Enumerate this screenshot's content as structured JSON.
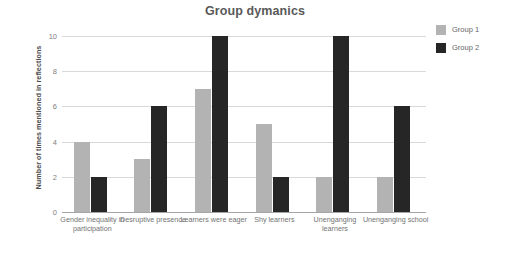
{
  "chart_data": {
    "type": "bar",
    "title": "Group dymanics",
    "xlabel": "",
    "ylabel": "Number of times mentioned in reflections",
    "ylim": [
      0,
      10
    ],
    "yticks": [
      0,
      2,
      4,
      6,
      8,
      10
    ],
    "grid": true,
    "legend_position": "right",
    "categories": [
      "Gender inequality in participation",
      "Desruptive presence",
      "Learners were eager",
      "Shy learners",
      "Unenganging learners",
      "Unenganging school"
    ],
    "series": [
      {
        "name": "Group 1",
        "color": "#b3b3b3",
        "values": [
          4,
          3,
          7,
          5,
          2,
          2
        ]
      },
      {
        "name": "Group 2",
        "color": "#262626",
        "values": [
          2,
          6,
          10,
          2,
          10,
          6
        ]
      }
    ]
  }
}
